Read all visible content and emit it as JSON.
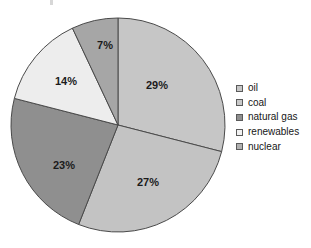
{
  "chart_data": {
    "type": "pie",
    "title": "",
    "subtitle": "",
    "xlabel": "",
    "ylabel": "",
    "grid": false,
    "legend_position": "right",
    "start_angle_deg": 0,
    "direction": "clockwise",
    "units": "percent",
    "center": {
      "x": 118,
      "y": 125
    },
    "radius": 107,
    "categories": [
      "oil",
      "coal",
      "natural gas",
      "renewables",
      "nuclear"
    ],
    "values": [
      29,
      27,
      23,
      14,
      7
    ],
    "data_labels": [
      "29%",
      "27%",
      "23%",
      "14%",
      "7%"
    ],
    "slice_colors": [
      "#c6c6c6",
      "#c3c3c3",
      "#8f8f8f",
      "#ededed",
      "#a6a6a6"
    ],
    "slices": [
      {
        "name": "oil",
        "value": 29,
        "label": "29%",
        "color": "#c6c6c6",
        "label_x": 157,
        "label_y": 86
      },
      {
        "name": "coal",
        "value": 27,
        "label": "27%",
        "color": "#c3c3c3",
        "label_x": 148,
        "label_y": 183
      },
      {
        "name": "natural gas",
        "value": 23,
        "label": "23%",
        "color": "#8f8f8f",
        "label_x": 64,
        "label_y": 166
      },
      {
        "name": "renewables",
        "value": 14,
        "label": "14%",
        "color": "#ededed",
        "label_x": 66,
        "label_y": 82
      },
      {
        "name": "nuclear",
        "value": 7,
        "label": "7%",
        "color": "#a6a6a6",
        "label_x": 105,
        "label_y": 46
      }
    ],
    "outline_color": "#4a4a4a"
  },
  "legend": {
    "items": [
      {
        "label": "oil",
        "color": "#c6c6c6"
      },
      {
        "label": "coal",
        "color": "#c9c9c9"
      },
      {
        "label": "natural gas",
        "color": "#8f8f8f"
      },
      {
        "label": "renewables",
        "color": "#f2f2f2"
      },
      {
        "label": "nuclear",
        "color": "#b0b0b0"
      }
    ]
  }
}
